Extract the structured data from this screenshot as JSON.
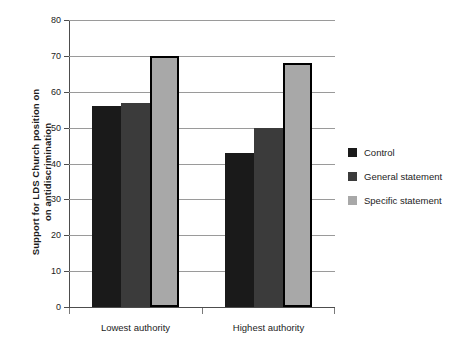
{
  "chart_data": {
    "type": "bar",
    "title": "",
    "xlabel": "",
    "ylabel_lines": [
      "Support for LDS Church position on",
      "on antidiscrimination"
    ],
    "categories": [
      "Lowest authority",
      "Highest authority"
    ],
    "series": [
      {
        "name": "Control",
        "color": "#1a1a1a",
        "outlined": false,
        "values": [
          56,
          43
        ]
      },
      {
        "name": "General statement",
        "color": "#3b3b3b",
        "outlined": false,
        "values": [
          57,
          50
        ]
      },
      {
        "name": "Specific statement",
        "color": "#a8a8a8",
        "outlined": true,
        "values": [
          70,
          68
        ]
      }
    ],
    "ylim": [
      0,
      80
    ],
    "ytick_step": 10,
    "ytick_labels": [
      "80",
      "70",
      "60",
      "50",
      "40",
      "30",
      "20",
      "10",
      "0"
    ],
    "grid": true,
    "legend_position": "right"
  },
  "legend": {
    "items": [
      {
        "label": "Control",
        "color": "#1a1a1a"
      },
      {
        "label": "General statement",
        "color": "#3b3b3b"
      },
      {
        "label": "Specific statement",
        "color": "#a8a8a8"
      }
    ]
  }
}
